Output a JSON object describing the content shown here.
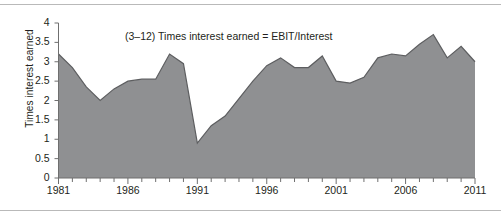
{
  "annotation": {
    "text": "(3–12) Times interest earned = EBIT/Interest"
  },
  "colors": {
    "area_fill": "#8f9092",
    "area_stroke": "#5d5e60",
    "axis": "#6f6f6f",
    "text": "#231f20",
    "background": "#ffffff",
    "frame_rule": "#b9b9b9"
  },
  "chart_data": {
    "type": "area",
    "title": "",
    "annotation": "(3–12) Times interest earned = EBIT/Interest",
    "xlabel": "",
    "ylabel": "Times interest earned",
    "xlim": [
      1981,
      2011
    ],
    "ylim": [
      0,
      4
    ],
    "grid": false,
    "legend": "none",
    "y_ticks": [
      0,
      0.5,
      1,
      1.5,
      2,
      2.5,
      3,
      3.5,
      4
    ],
    "y_tick_labels": [
      "0",
      "0.5",
      "1",
      "1.5",
      "2",
      "2.5",
      "3",
      "3.5",
      "4"
    ],
    "x_ticks": [
      1981,
      1986,
      1991,
      1996,
      2001,
      2006,
      2011
    ],
    "x_tick_labels": [
      "1981",
      "1986",
      "1991",
      "1996",
      "2001",
      "2006",
      "2011"
    ],
    "x_minor_tick_step": 1,
    "x": [
      1981,
      1982,
      1983,
      1984,
      1985,
      1986,
      1987,
      1988,
      1989,
      1990,
      1991,
      1992,
      1993,
      1994,
      1995,
      1996,
      1997,
      1998,
      1999,
      2000,
      2001,
      2002,
      2003,
      2004,
      2005,
      2006,
      2007,
      2008,
      2009,
      2010,
      2011
    ],
    "values": [
      3.2,
      2.85,
      2.35,
      2.0,
      2.3,
      2.5,
      2.55,
      2.55,
      3.2,
      2.95,
      0.9,
      1.35,
      1.6,
      2.05,
      2.5,
      2.9,
      3.1,
      2.85,
      2.85,
      3.15,
      2.5,
      2.45,
      2.6,
      3.1,
      3.2,
      3.15,
      3.45,
      3.7,
      3.1,
      3.4,
      3.0
    ],
    "series": [
      {
        "name": "Times interest earned",
        "values": [
          3.2,
          2.85,
          2.35,
          2.0,
          2.3,
          2.5,
          2.55,
          2.55,
          3.2,
          2.95,
          0.9,
          1.35,
          1.6,
          2.05,
          2.5,
          2.9,
          3.1,
          2.85,
          2.85,
          3.15,
          2.5,
          2.45,
          2.6,
          3.1,
          3.2,
          3.15,
          3.45,
          3.7,
          3.1,
          3.4,
          3.0
        ]
      }
    ]
  }
}
